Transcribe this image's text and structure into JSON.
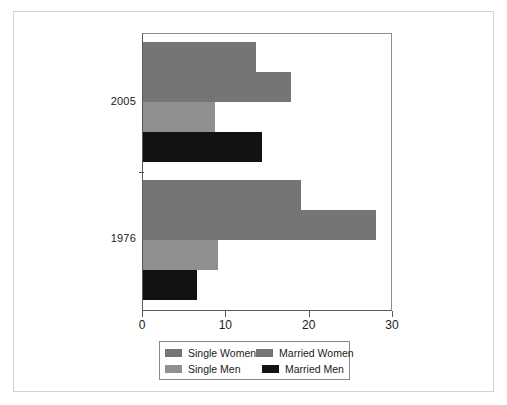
{
  "chart_data": {
    "type": "bar",
    "orientation": "horizontal",
    "title": "",
    "xlabel": "",
    "ylabel": "",
    "xlim": [
      0,
      30
    ],
    "xticks": [
      0,
      10,
      20,
      30
    ],
    "xtick_labels": [
      "0",
      "10",
      "20",
      "30"
    ],
    "grid": false,
    "legend_position": "bottom",
    "categories": [
      "2005",
      "1976"
    ],
    "series": [
      {
        "name": "Single Women",
        "color": "#757575",
        "values": [
          13.5,
          19.0
        ]
      },
      {
        "name": "Married Women",
        "color": "#757575",
        "values": [
          17.7,
          28.0
        ]
      },
      {
        "name": "Single Men",
        "color": "#8f8f8f",
        "values": [
          8.6,
          9.0
        ]
      },
      {
        "name": "Married Men",
        "color": "#121212",
        "values": [
          14.3,
          6.5
        ]
      }
    ]
  },
  "axis": {
    "group_labels": [
      "2005",
      "1976"
    ],
    "tick_labels": [
      "0",
      "10",
      "20",
      "30"
    ]
  },
  "legend": {
    "entries": [
      {
        "label": "Single Women",
        "color": "#757575"
      },
      {
        "label": "Married Women",
        "color": "#757575"
      },
      {
        "label": "Single Men",
        "color": "#8f8f8f"
      },
      {
        "label": "Married Men",
        "color": "#121212"
      }
    ]
  }
}
